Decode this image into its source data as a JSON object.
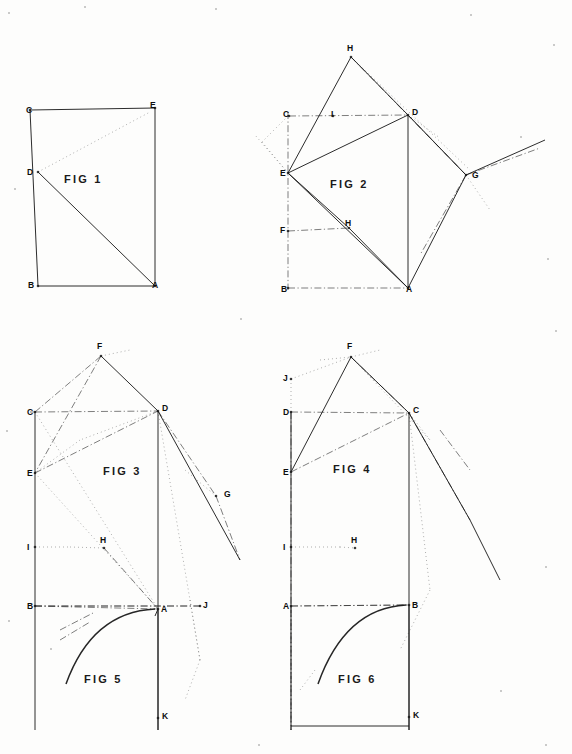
{
  "sheet": {
    "width": 572,
    "height": 754,
    "background_color": "#fdfdfc",
    "ink_color": "#1a1a1a",
    "type": "technical-line-drawing-sheet",
    "figure_count": 6
  },
  "figures": [
    {
      "id": "fig1",
      "caption": "FIG 1",
      "caption_x": 64,
      "caption_y": 173,
      "points": [
        {
          "label": "C",
          "x": 30,
          "y": 110,
          "lx": 26,
          "ly": 106
        },
        {
          "label": "E",
          "x": 155,
          "y": 108,
          "lx": 150,
          "ly": 101
        },
        {
          "label": "D",
          "x": 38,
          "y": 172,
          "lx": 27,
          "ly": 168
        },
        {
          "label": "B",
          "x": 38,
          "y": 286,
          "lx": 28,
          "ly": 281
        },
        {
          "label": "A",
          "x": 155,
          "y": 286,
          "lx": 152,
          "ly": 281
        }
      ]
    },
    {
      "id": "fig2",
      "caption": "FIG 2",
      "caption_x": 330,
      "caption_y": 178,
      "points": [
        {
          "label": "H",
          "x": 351,
          "y": 57,
          "lx": 347,
          "ly": 44
        },
        {
          "label": "C",
          "x": 289,
          "y": 116,
          "lx": 283,
          "ly": 110
        },
        {
          "label": "I",
          "x": 333,
          "y": 116,
          "lx": 331,
          "ly": 110
        },
        {
          "label": "D",
          "x": 408,
          "y": 115,
          "lx": 412,
          "ly": 108
        },
        {
          "label": "E",
          "x": 288,
          "y": 173,
          "lx": 280,
          "ly": 169
        },
        {
          "label": "G",
          "x": 466,
          "y": 175,
          "lx": 472,
          "ly": 171
        },
        {
          "label": "F",
          "x": 288,
          "y": 231,
          "lx": 280,
          "ly": 226
        },
        {
          "label": "H",
          "x": 349,
          "y": 228,
          "lx": 345,
          "ly": 219
        },
        {
          "label": "B",
          "x": 288,
          "y": 288,
          "lx": 281,
          "ly": 285
        },
        {
          "label": "A",
          "x": 408,
          "y": 288,
          "lx": 406,
          "ly": 285
        }
      ]
    },
    {
      "id": "fig3",
      "caption": "FIG 3",
      "caption_x": 103,
      "caption_y": 465,
      "points": [
        {
          "label": "F",
          "x": 101,
          "y": 356,
          "lx": 97,
          "ly": 342
        },
        {
          "label": "C",
          "x": 35,
          "y": 412,
          "lx": 27,
          "ly": 408
        },
        {
          "label": "D",
          "x": 158,
          "y": 411,
          "lx": 162,
          "ly": 404
        },
        {
          "label": "E",
          "x": 35,
          "y": 473,
          "lx": 27,
          "ly": 469
        },
        {
          "label": "G",
          "x": 216,
          "y": 496,
          "lx": 224,
          "ly": 490
        },
        {
          "label": "I",
          "x": 35,
          "y": 547,
          "lx": 27,
          "ly": 543
        },
        {
          "label": "H",
          "x": 104,
          "y": 548,
          "lx": 100,
          "ly": 536
        },
        {
          "label": "J",
          "x": 200,
          "y": 606,
          "lx": 203,
          "ly": 601
        }
      ]
    },
    {
      "id": "fig4",
      "caption": "FIG 4",
      "caption_x": 333,
      "caption_y": 463,
      "points": [
        {
          "label": "F",
          "x": 351,
          "y": 357,
          "lx": 347,
          "ly": 342
        },
        {
          "label": "J",
          "x": 291,
          "y": 379,
          "lx": 283,
          "ly": 374
        },
        {
          "label": "D",
          "x": 291,
          "y": 412,
          "lx": 283,
          "ly": 408
        },
        {
          "label": "C",
          "x": 409,
          "y": 413,
          "lx": 413,
          "ly": 406
        },
        {
          "label": "E",
          "x": 291,
          "y": 472,
          "lx": 283,
          "ly": 468
        },
        {
          "label": "I",
          "x": 291,
          "y": 547,
          "lx": 283,
          "ly": 543
        },
        {
          "label": "H",
          "x": 355,
          "y": 548,
          "lx": 351,
          "ly": 536
        }
      ]
    },
    {
      "id": "fig5",
      "caption": "FIG 5",
      "caption_x": 84,
      "caption_y": 673,
      "points": [
        {
          "label": "B",
          "x": 35,
          "y": 606,
          "lx": 27,
          "ly": 602
        },
        {
          "label": "A",
          "x": 158,
          "y": 609,
          "lx": 161,
          "ly": 605
        },
        {
          "label": "K",
          "x": 158,
          "y": 718,
          "lx": 162,
          "ly": 712
        }
      ]
    },
    {
      "id": "fig6",
      "caption": "FIG 6",
      "caption_x": 338,
      "caption_y": 673,
      "points": [
        {
          "label": "A",
          "x": 291,
          "y": 606,
          "lx": 283,
          "ly": 602
        },
        {
          "label": "B",
          "x": 409,
          "y": 605,
          "lx": 412,
          "ly": 601
        },
        {
          "label": "K",
          "x": 409,
          "y": 717,
          "lx": 413,
          "ly": 711
        }
      ]
    }
  ],
  "geometry": {
    "fig1": {
      "solid": [
        "M30,110 L155,108",
        "M30,110 L38,286",
        "M155,108 L155,286",
        "M38,286 L155,286",
        "M38,172 L155,286"
      ],
      "dotted": [
        "M38,172 L150,112"
      ]
    },
    "fig2": {
      "solid": [
        "M288,173 L408,115",
        "M288,173 L408,288",
        "M408,115 L408,288",
        "M288,173 L351,57",
        "M351,57 L408,115",
        "M288,173 L349,228",
        "M349,228 L408,288",
        "M408,115 L466,175",
        "M466,175 L408,288",
        "M466,175 L545,140"
      ],
      "dashdot": [
        "M288,112 L288,290",
        "M289,116 L408,115",
        "M288,288 L408,288",
        "M288,231 L349,228",
        "M408,115 L466,175",
        "M466,175 L420,255",
        "M351,57 L466,175",
        "M466,175 L540,148"
      ],
      "dotted": [
        "M351,57 L470,170",
        "M288,173 L255,135",
        "M288,116 L262,142",
        "M262,142 L288,173",
        "M408,115 L440,138",
        "M466,175 L490,210"
      ]
    },
    "fig3": {
      "solid": [
        "M35,412 L35,620",
        "M158,411 L158,730",
        "M101,356 L158,411",
        "M158,411 L240,560"
      ],
      "dashdot": [
        "M35,412 L158,411",
        "M35,606 L200,606",
        "M35,412 L101,356",
        "M101,356 L35,473",
        "M35,473 L158,411",
        "M104,548 L158,609",
        "M158,411 L216,496",
        "M216,496 L240,560",
        "M60,630 L95,612",
        "M30,412 L35,412"
      ],
      "dotted": [
        "M35,412 L158,609",
        "M35,473 L158,609",
        "M101,356 L130,350",
        "M158,411 L190,600",
        "M190,600 L200,660",
        "M35,547 L70,547",
        "M70,547 L104,548",
        "M185,470 L216,496",
        "M158,411 L80,440",
        "M80,440 L35,473"
      ]
    },
    "fig4": {
      "solid": [
        "M291,412 L291,620",
        "M409,413 L409,730",
        "M291,472 L351,357",
        "M351,357 L409,413",
        "M409,413 L470,520",
        "M470,520 L500,580"
      ],
      "dashdot": [
        "M291,412 L409,413",
        "M291,606 L409,605",
        "M291,412 L291,730",
        "M409,413 L470,520",
        "M351,357 L409,413",
        "M291,472 L409,413",
        "M440,430 L470,470"
      ],
      "dotted": [
        "M291,379 L351,357",
        "M291,379 L291,412",
        "M351,357 L409,413",
        "M351,357 L430,440",
        "M430,440 L409,413",
        "M291,547 L340,547",
        "M340,547 L355,548",
        "M351,357 L380,350",
        "M409,413 L430,590",
        "M430,590 L400,650",
        "M320,360 L351,357"
      ]
    },
    "fig5": {
      "solid": [
        "M158,609 L155,616",
        "M35,620 L35,730",
        "M158,609 L158,730"
      ],
      "arc": "M155,609 Q92,612 66,684",
      "dashdot": [
        "M35,606 L158,609",
        "M35,606 L200,606",
        "M60,640 L90,622"
      ],
      "dotted": [
        "M190,600 L200,660",
        "M200,660 L185,700"
      ]
    },
    "fig6": {
      "solid": [
        "M291,620 L291,730",
        "M409,605 L409,730",
        "M291,726 L409,726"
      ],
      "arc": "M406,605 Q345,608 318,684",
      "dashdot": [
        "M291,606 L409,605",
        "M291,606 L291,730"
      ],
      "dotted": [
        "M300,690 L315,670"
      ]
    }
  },
  "specks": [
    {
      "x": 8,
      "y": 12,
      "r": 1.2
    },
    {
      "x": 84,
      "y": 6,
      "r": 1.0
    },
    {
      "x": 215,
      "y": 8,
      "r": 1.0
    },
    {
      "x": 470,
      "y": 14,
      "r": 1.0
    },
    {
      "x": 553,
      "y": 44,
      "r": 1.0
    },
    {
      "x": 14,
      "y": 188,
      "r": 1.1
    },
    {
      "x": 547,
      "y": 258,
      "r": 1.0
    },
    {
      "x": 520,
      "y": 136,
      "r": 1.1
    },
    {
      "x": 8,
      "y": 620,
      "r": 1.0
    },
    {
      "x": 50,
      "y": 648,
      "r": 1.0
    },
    {
      "x": 500,
      "y": 690,
      "r": 1.0
    },
    {
      "x": 545,
      "y": 566,
      "r": 1.0
    },
    {
      "x": 545,
      "y": 744,
      "r": 1.0
    },
    {
      "x": 258,
      "y": 744,
      "r": 1.0
    },
    {
      "x": 6,
      "y": 430,
      "r": 1.0
    },
    {
      "x": 240,
      "y": 318,
      "r": 1.0
    },
    {
      "x": 555,
      "y": 330,
      "r": 1.0
    }
  ]
}
